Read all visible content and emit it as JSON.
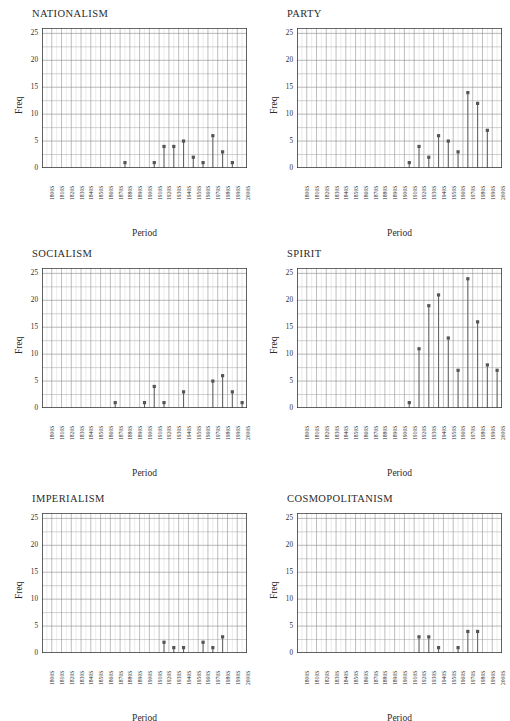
{
  "figure": {
    "axis_label_x": "Period",
    "axis_label_y": "Freq",
    "ylim": [
      0,
      26
    ],
    "yticks": [
      0,
      5,
      10,
      15,
      20,
      25
    ],
    "ytick_labels": [
      "0",
      "5",
      "10",
      "15",
      "20",
      "25"
    ],
    "categories": [
      "1800S",
      "1810S",
      "1820S",
      "1830S",
      "1840S",
      "1850S",
      "1860S",
      "1870S",
      "1880S",
      "1890S",
      "1900S",
      "1910S",
      "1920S",
      "1930S",
      "1940S",
      "1950S",
      "1960S",
      "1970S",
      "1980S",
      "1990S",
      "2000S"
    ],
    "grid": true,
    "marker_color": "#555555",
    "stem_color": "#666666",
    "axis_color": "#3a3a3a",
    "grid_color": "#8a8a8a"
  },
  "chart_data": [
    {
      "type": "bar",
      "title": "NATIONALISM",
      "xlabel": "Period",
      "ylabel": "Freq",
      "ylim": [
        0,
        26
      ],
      "categories": [
        "1800S",
        "1810S",
        "1820S",
        "1830S",
        "1840S",
        "1850S",
        "1860S",
        "1870S",
        "1880S",
        "1890S",
        "1900S",
        "1910S",
        "1920S",
        "1930S",
        "1940S",
        "1950S",
        "1960S",
        "1970S",
        "1980S",
        "1990S",
        "2000S"
      ],
      "values": [
        0,
        0,
        0,
        0,
        0,
        0,
        0,
        0,
        1,
        0,
        0,
        1,
        4,
        4,
        5,
        2,
        1,
        6,
        3,
        1,
        0
      ]
    },
    {
      "type": "bar",
      "title": "PARTY",
      "xlabel": "Period",
      "ylabel": "Freq",
      "ylim": [
        0,
        26
      ],
      "categories": [
        "1800S",
        "1810S",
        "1820S",
        "1830S",
        "1840S",
        "1850S",
        "1860S",
        "1870S",
        "1880S",
        "1890S",
        "1900S",
        "1910S",
        "1920S",
        "1930S",
        "1940S",
        "1950S",
        "1960S",
        "1970S",
        "1980S",
        "1990S",
        "2000S"
      ],
      "values": [
        0,
        0,
        0,
        0,
        0,
        0,
        0,
        0,
        0,
        0,
        0,
        1,
        4,
        2,
        6,
        5,
        3,
        14,
        12,
        7,
        0
      ]
    },
    {
      "type": "bar",
      "title": "SOCIALISM",
      "xlabel": "Period",
      "ylabel": "Freq",
      "ylim": [
        0,
        26
      ],
      "categories": [
        "1800S",
        "1810S",
        "1820S",
        "1830S",
        "1840S",
        "1850S",
        "1860S",
        "1870S",
        "1880S",
        "1890S",
        "1900S",
        "1910S",
        "1920S",
        "1930S",
        "1940S",
        "1950S",
        "1960S",
        "1970S",
        "1980S",
        "1990S",
        "2000S"
      ],
      "values": [
        0,
        0,
        0,
        0,
        0,
        0,
        0,
        1,
        0,
        0,
        1,
        4,
        1,
        0,
        3,
        0,
        0,
        5,
        6,
        3,
        1
      ]
    },
    {
      "type": "bar",
      "title": "SPIRIT",
      "xlabel": "Period",
      "ylabel": "Freq",
      "ylim": [
        0,
        26
      ],
      "categories": [
        "1800S",
        "1810S",
        "1820S",
        "1830S",
        "1840S",
        "1850S",
        "1860S",
        "1870S",
        "1880S",
        "1890S",
        "1900S",
        "1910S",
        "1920S",
        "1930S",
        "1940S",
        "1950S",
        "1960S",
        "1970S",
        "1980S",
        "1990S",
        "2000S"
      ],
      "values": [
        0,
        0,
        0,
        0,
        0,
        0,
        0,
        0,
        0,
        0,
        0,
        1,
        11,
        19,
        21,
        13,
        7,
        24,
        16,
        8,
        7
      ]
    },
    {
      "type": "bar",
      "title": "IMPERIALISM",
      "xlabel": "Period",
      "ylabel": "Freq",
      "ylim": [
        0,
        26
      ],
      "categories": [
        "1800S",
        "1810S",
        "1820S",
        "1830S",
        "1840S",
        "1850S",
        "1860S",
        "1870S",
        "1880S",
        "1890S",
        "1900S",
        "1910S",
        "1920S",
        "1930S",
        "1940S",
        "1950S",
        "1960S",
        "1970S",
        "1980S",
        "1990S",
        "2000S"
      ],
      "values": [
        0,
        0,
        0,
        0,
        0,
        0,
        0,
        0,
        0,
        0,
        0,
        0,
        2,
        1,
        1,
        0,
        2,
        1,
        3,
        0,
        0
      ]
    },
    {
      "type": "bar",
      "title": "COSMOPOLITANISM",
      "xlabel": "Period",
      "ylabel": "Freq",
      "ylim": [
        0,
        26
      ],
      "categories": [
        "1800S",
        "1810S",
        "1820S",
        "1830S",
        "1840S",
        "1850S",
        "1860S",
        "1870S",
        "1880S",
        "1890S",
        "1900S",
        "1910S",
        "1920S",
        "1930S",
        "1940S",
        "1950S",
        "1960S",
        "1970S",
        "1980S",
        "1990S",
        "2000S"
      ],
      "values": [
        0,
        0,
        0,
        0,
        0,
        0,
        0,
        0,
        0,
        0,
        0,
        0,
        3,
        3,
        1,
        0,
        1,
        4,
        4,
        0,
        0
      ]
    }
  ]
}
